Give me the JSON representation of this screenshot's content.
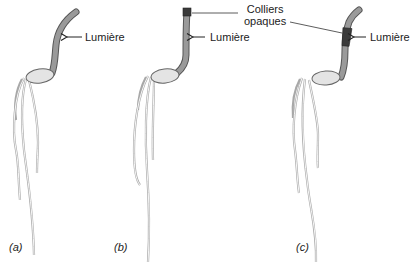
{
  "figure": {
    "colors": {
      "coleoptile_fill": "#9a9a9a",
      "seed_fill": "#e4e4e4",
      "collar_fill": "#3a3a3a",
      "line": "#555555",
      "root": "#bdbdbd",
      "text": "#222222"
    },
    "labels": {
      "light": "Lumière",
      "collars_line1": "Colliers",
      "collars_line2": "opaques"
    },
    "panels": [
      {
        "id": "a",
        "label": "(a)",
        "light_label": "Lumière",
        "collar": "none",
        "response": "bends toward light"
      },
      {
        "id": "b",
        "label": "(b)",
        "light_label": "Lumière",
        "collar": "tip covered",
        "response": "grows straight"
      },
      {
        "id": "c",
        "label": "(c)",
        "light_label": "Lumière",
        "collar": "below tip",
        "response": "bends toward light"
      }
    ]
  }
}
